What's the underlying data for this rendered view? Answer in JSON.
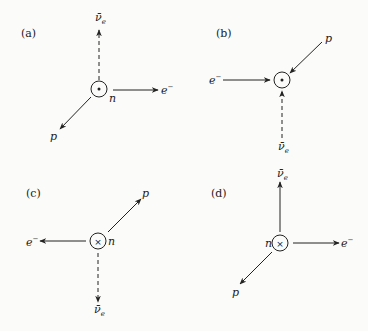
{
  "figure": {
    "panels": [
      {
        "id": "a",
        "label": "(a)",
        "nucleon": "n",
        "spin_symbol": "dot",
        "particles": [
          {
            "name": "antineutrino",
            "symbol": "ν̄",
            "subscript": "e",
            "direction": "up",
            "outgoing": true,
            "dashed": true
          },
          {
            "name": "electron",
            "symbol": "e",
            "superscript": "−",
            "direction": "right",
            "outgoing": true,
            "dashed": false
          },
          {
            "name": "proton",
            "symbol": "p",
            "direction": "down-left",
            "outgoing": true,
            "dashed": false
          }
        ]
      },
      {
        "id": "b",
        "label": "(b)",
        "nucleon": "",
        "spin_symbol": "dot",
        "particles": [
          {
            "name": "electron",
            "symbol": "e",
            "superscript": "−",
            "direction": "left",
            "outgoing": false,
            "dashed": false
          },
          {
            "name": "proton",
            "symbol": "p",
            "direction": "up-right",
            "outgoing": false,
            "dashed": false
          },
          {
            "name": "antineutrino",
            "symbol": "ν̄",
            "subscript": "e",
            "direction": "down",
            "outgoing": false,
            "dashed": true
          }
        ]
      },
      {
        "id": "c",
        "label": "(c)",
        "nucleon": "n",
        "spin_symbol": "cross",
        "particles": [
          {
            "name": "electron",
            "symbol": "e",
            "superscript": "−",
            "direction": "left",
            "outgoing": true,
            "dashed": false
          },
          {
            "name": "proton",
            "symbol": "p",
            "direction": "up-right",
            "outgoing": true,
            "dashed": false
          },
          {
            "name": "antineutrino",
            "symbol": "ν̄",
            "subscript": "e",
            "direction": "down",
            "outgoing": true,
            "dashed": true
          }
        ]
      },
      {
        "id": "d",
        "label": "(d)",
        "nucleon": "n",
        "spin_symbol": "cross",
        "particles": [
          {
            "name": "antineutrino",
            "symbol": "ν̄",
            "subscript": "e",
            "direction": "up",
            "outgoing": true,
            "dashed": false
          },
          {
            "name": "electron",
            "symbol": "e",
            "superscript": "−",
            "direction": "right",
            "outgoing": true,
            "dashed": false
          },
          {
            "name": "proton",
            "symbol": "p",
            "direction": "down-left",
            "outgoing": true,
            "dashed": false
          }
        ]
      }
    ]
  }
}
